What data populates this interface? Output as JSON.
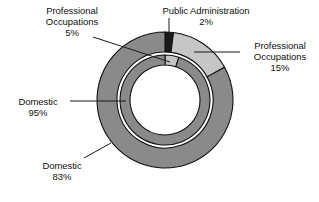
{
  "chart_data": {
    "type": "pie",
    "title": "",
    "subtitle": "",
    "variant": "nested-donut",
    "legend_position": "callout-labels",
    "grid": false,
    "rings": [
      {
        "name": "outer-ring",
        "start_angle_deg": 0,
        "direction": "clockwise",
        "slices": [
          {
            "label": "Public Administration",
            "value": 2,
            "display": "2%",
            "color": "#1a1a1a"
          },
          {
            "label": "Professional Occupations",
            "value": 15,
            "display": "15%",
            "color": "#c6c6c6"
          },
          {
            "label": "Domestic",
            "value": 83,
            "display": "83%",
            "color": "#8a8a8a"
          }
        ]
      },
      {
        "name": "inner-ring",
        "start_angle_deg": 0,
        "direction": "clockwise",
        "slices": [
          {
            "label": "Professional Occupations",
            "value": 5,
            "display": "5%",
            "color": "#c6c6c6"
          },
          {
            "label": "Domestic",
            "value": 95,
            "display": "95%",
            "color": "#8a8a8a"
          }
        ]
      }
    ],
    "categories": [
      "Public Administration",
      "Professional Occupations",
      "Domestic"
    ],
    "series": [
      {
        "name": "outer-ring",
        "values": [
          2,
          15,
          83
        ]
      },
      {
        "name": "inner-ring",
        "values": [
          0,
          5,
          95
        ]
      }
    ]
  },
  "labels": {
    "prof_inner": {
      "line1": "Professional",
      "line2": "Occupations",
      "line3": "5%"
    },
    "public_administration": {
      "line1": "Public Administration",
      "line2": "2%",
      "line3": ""
    },
    "prof_outer": {
      "line1": "Professional",
      "line2": "Occupations",
      "line3": "15%"
    },
    "domestic_inner": {
      "line1": "Domestic",
      "line2": "95%",
      "line3": ""
    },
    "domestic_outer": {
      "line1": "Domestic",
      "line2": "83%",
      "line3": ""
    }
  },
  "colors": {
    "dark_slice": "#1a1a1a",
    "light_slice": "#c6c6c6",
    "medium_slice": "#8a8a8a",
    "outline": "#111111",
    "background": "#ffffff",
    "leader_line": "#1a1a1a",
    "text": "#101010"
  }
}
